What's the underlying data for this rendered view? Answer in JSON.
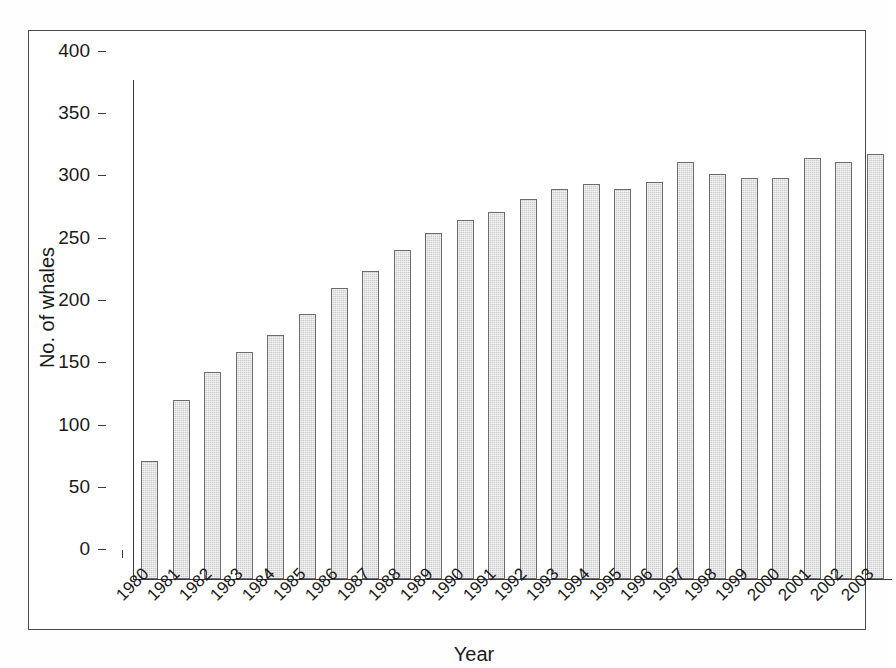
{
  "chart_data": {
    "type": "bar",
    "title": "",
    "subtitle": "",
    "xlabel": "Year",
    "ylabel": "No. of whales",
    "categories": [
      "1980",
      "1981",
      "1982",
      "1983",
      "1984",
      "1985",
      "1986",
      "1987",
      "1988",
      "1989",
      "1990",
      "1991",
      "1992",
      "1993",
      "1994",
      "1995",
      "1996",
      "1997",
      "1998",
      "1999",
      "2000",
      "2001",
      "2002",
      "2003"
    ],
    "values": [
      95,
      144,
      166,
      182,
      196,
      213,
      234,
      247,
      264,
      278,
      288,
      295,
      305,
      313,
      317,
      313,
      319,
      335,
      325,
      322,
      322,
      338,
      335,
      341
    ],
    "series": [
      {
        "name": "No. of whales",
        "values": [
          95,
          144,
          166,
          182,
          196,
          213,
          234,
          247,
          264,
          278,
          288,
          295,
          305,
          313,
          317,
          313,
          319,
          335,
          325,
          322,
          322,
          338,
          335,
          341
        ]
      }
    ],
    "ylim": [
      0,
      400
    ],
    "yticks": [
      0,
      50,
      100,
      150,
      200,
      250,
      300,
      350,
      400
    ],
    "ytick_labels": [
      "0",
      "50",
      "100",
      "150",
      "200",
      "250",
      "300",
      "350",
      "400"
    ],
    "grid": false,
    "legend": null,
    "legend_position": "none",
    "bar_fill_color": "#cdcdcd",
    "bar_edge_color": "#6b6b6b",
    "axis_color": "#3a3a3a",
    "frame_color": "#4a4a4a",
    "background_color": "#ffffff",
    "xtick_label_rotation": "-45"
  }
}
